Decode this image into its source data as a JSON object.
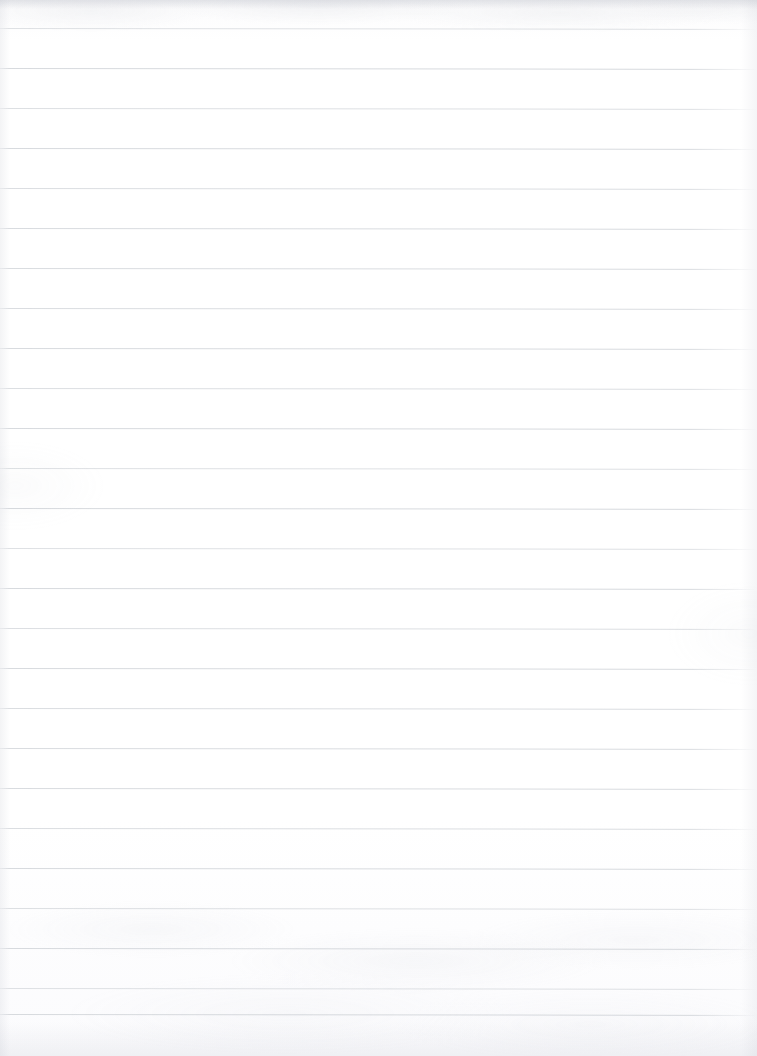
{
  "document": {
    "kind": "scanned-ruled-notebook-page",
    "title": "Blank Ruled Notebook Page",
    "page_width_px": 757,
    "page_height_px": 1056,
    "orientation": "portrait",
    "written_content": "",
    "written_content_note": "The page is blank — no handwriting, printed text, headings, page numbers or marginalia are visible.",
    "paper": {
      "background_color": "#ffffff",
      "tint_color": "#fbfbfc",
      "texture": "faint mottled scanner grain, strongest along the top edge and across the lower third"
    },
    "ruling": {
      "style": "horizontal feint ruled",
      "line_color": "#d7dade",
      "line_thickness_px": 1,
      "line_spacing_px": 40,
      "first_line_y_px": 28,
      "line_count": 26,
      "full_bleed": true,
      "right_fade_start_px": 690,
      "slant_note": "lines drift very slightly downward toward the right, about 1px over the page width",
      "line_y_positions": [
        28,
        68,
        108,
        148,
        188,
        228,
        268,
        308,
        348,
        388,
        428,
        468,
        508,
        548,
        588,
        628,
        668,
        708,
        748,
        788,
        828,
        868,
        908,
        948,
        988,
        1014
      ],
      "margin_rule": "none",
      "holes": "none"
    },
    "edges": {
      "top_artifact_color": "#a8acb8",
      "bottom_artifact_color": "#b2b6c2",
      "side_artifact_color": "#b4b8c3"
    }
  }
}
